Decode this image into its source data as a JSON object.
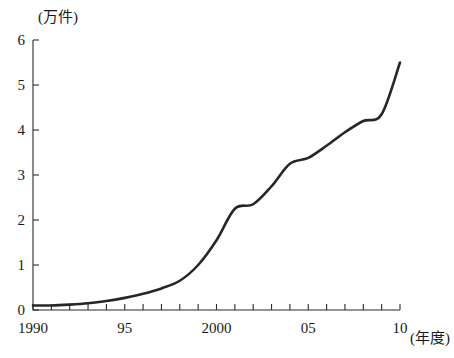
{
  "chart_data": {
    "type": "line",
    "title": "",
    "subtitle": "",
    "xlabel": "(年度)",
    "ylabel": "(万件)",
    "x": [
      1990,
      1991,
      1992,
      1993,
      1994,
      1995,
      1996,
      1997,
      1998,
      1999,
      2000,
      2001,
      2002,
      2003,
      2004,
      2005,
      2006,
      2007,
      2008,
      2009,
      2010
    ],
    "values": [
      0.1,
      0.1,
      0.12,
      0.15,
      0.2,
      0.27,
      0.36,
      0.48,
      0.65,
      1.0,
      1.55,
      2.25,
      2.35,
      2.75,
      3.25,
      3.38,
      3.65,
      3.95,
      4.2,
      4.35,
      5.5
    ],
    "series": [
      {
        "name": "件数",
        "values": [
          0.1,
          0.1,
          0.12,
          0.15,
          0.2,
          0.27,
          0.36,
          0.48,
          0.65,
          1.0,
          1.55,
          2.25,
          2.35,
          2.75,
          3.25,
          3.38,
          3.65,
          3.95,
          4.2,
          4.35,
          5.5
        ]
      }
    ],
    "xlim": [
      1990,
      2010
    ],
    "ylim": [
      0,
      6
    ],
    "ytick_labels": [
      "0",
      "1",
      "2",
      "3",
      "4",
      "5",
      "6"
    ],
    "ytick_values": [
      0,
      1,
      2,
      3,
      4,
      5,
      6
    ],
    "xtick_values": [
      1990,
      1991,
      1992,
      1993,
      1994,
      1995,
      1996,
      1997,
      1998,
      1999,
      2000,
      2001,
      2002,
      2003,
      2004,
      2005,
      2006,
      2007,
      2008,
      2009,
      2010
    ],
    "xtick_labeled_values": [
      1990,
      1995,
      2000,
      2005,
      2010
    ],
    "xtick_labels": [
      "1990",
      "95",
      "2000",
      "05",
      "10"
    ],
    "grid": false,
    "legend": null,
    "legend_position": "none",
    "line_color": "#262626"
  },
  "axis_labels": {
    "y_unit": "(万件)",
    "x_unit": "(年度)"
  },
  "ytick_labels": {
    "0": "0",
    "1": "1",
    "2": "2",
    "3": "3",
    "4": "4",
    "5": "5",
    "6": "6"
  },
  "xtick_labels": {
    "0": "1990",
    "1": "95",
    "2": "2000",
    "3": "05",
    "4": "10"
  }
}
